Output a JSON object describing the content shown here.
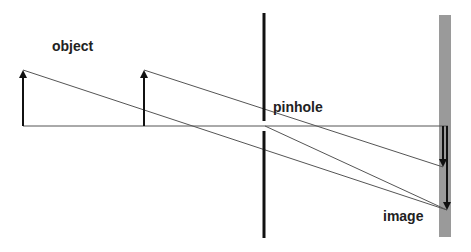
{
  "diagram": {
    "labels": {
      "object": "object",
      "pinhole": "pinhole",
      "image": "image"
    },
    "colors": {
      "line": "#555555",
      "arrow": "#111111",
      "screen": "#111111",
      "image_plane": "#9a9a9a"
    }
  }
}
